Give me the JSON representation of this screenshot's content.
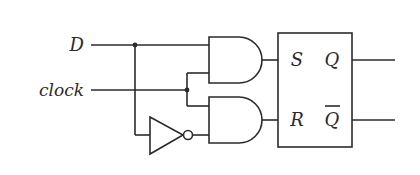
{
  "diagram": {
    "type": "gated D latch (logic circuit)",
    "inputs": [
      {
        "label": "D"
      },
      {
        "label": "clock"
      }
    ],
    "gates": [
      {
        "type": "AND",
        "inputs": [
          "D",
          "clock"
        ],
        "output": "S"
      },
      {
        "type": "NOT",
        "inputs": [
          "D"
        ],
        "output": "D'"
      },
      {
        "type": "AND",
        "inputs": [
          "clock",
          "D'"
        ],
        "output": "R"
      }
    ],
    "latch": {
      "type": "SR latch",
      "inputs": {
        "set": "S",
        "reset": "R"
      },
      "outputs": {
        "q": "Q",
        "q_bar": "Q"
      }
    },
    "colors": {
      "line": "#2b2b2b",
      "background": "#ffffff"
    }
  }
}
